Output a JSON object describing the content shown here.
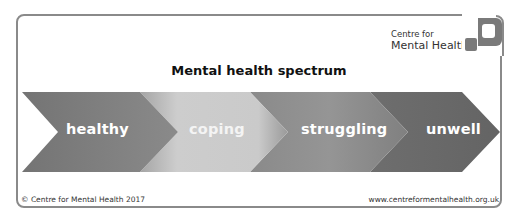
{
  "brand": {
    "line1": "Centre for",
    "line2": "Mental Health",
    "logo_icon": "cmh-logo-icon",
    "logo_color": "#7a7a7a"
  },
  "title": "Mental health spectrum",
  "stages": [
    {
      "label": "healthy",
      "color": "#747474"
    },
    {
      "label": "coping",
      "color": "#c9c9c9"
    },
    {
      "label": "struggling",
      "color": "#8c8c8c"
    },
    {
      "label": "unwell",
      "color": "#666666"
    }
  ],
  "footer": {
    "copyright": "© Centre for Mental Health 2017",
    "url": "www.centreformentalhealth.org.uk"
  },
  "colors": {
    "frame": "#8a8a8a",
    "text": "#111111"
  }
}
